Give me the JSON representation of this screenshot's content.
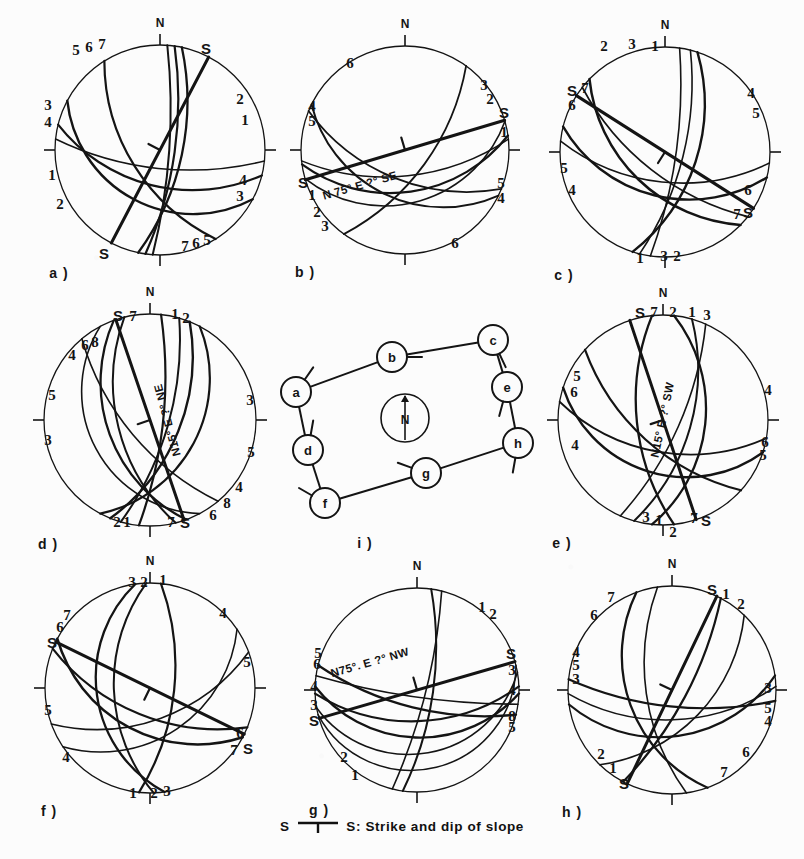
{
  "figure": {
    "background_color": "#fcfcfc",
    "ink_color": "#141414",
    "caption": {
      "left_symbol": "S",
      "right_symbol": "S",
      "text": ": Strike and dip of slope",
      "icon": "strike-dip-symbol"
    }
  },
  "panels": [
    {
      "id": "a",
      "label": "a )",
      "kind": "stereonet",
      "north_label": "N",
      "cx": 160,
      "cy": 150,
      "r": 105,
      "slope_markers": [
        {
          "text": "S",
          "x": 206,
          "y": 48
        },
        {
          "text": "S",
          "x": 104,
          "y": 253
        }
      ],
      "annotation": null,
      "rim_numbers": [
        {
          "n": "5",
          "x": 76,
          "y": 50
        },
        {
          "n": "6",
          "x": 89,
          "y": 47
        },
        {
          "n": "7",
          "x": 102,
          "y": 44
        },
        {
          "n": "3",
          "x": 48,
          "y": 105
        },
        {
          "n": "4",
          "x": 48,
          "y": 122
        },
        {
          "n": "1",
          "x": 52,
          "y": 175
        },
        {
          "n": "2",
          "x": 60,
          "y": 204
        },
        {
          "n": "2",
          "x": 240,
          "y": 99
        },
        {
          "n": "1",
          "x": 245,
          "y": 120
        },
        {
          "n": "4",
          "x": 243,
          "y": 180
        },
        {
          "n": "3",
          "x": 240,
          "y": 196
        },
        {
          "n": "7",
          "x": 185,
          "y": 246
        },
        {
          "n": "6",
          "x": 196,
          "y": 243
        },
        {
          "n": "5",
          "x": 207,
          "y": 240
        }
      ]
    },
    {
      "id": "b",
      "label": "b )",
      "kind": "stereonet",
      "north_label": "N",
      "cx": 405,
      "cy": 150,
      "r": 104,
      "slope_markers": [
        {
          "text": "S",
          "x": 504,
          "y": 112
        },
        {
          "text": "S",
          "x": 303,
          "y": 182
        }
      ],
      "annotation": {
        "text": "N 75° E ?° SE",
        "x": 360,
        "y": 186,
        "rotate": -16
      },
      "rim_numbers": [
        {
          "n": "6",
          "x": 350,
          "y": 63
        },
        {
          "n": "4",
          "x": 312,
          "y": 106
        },
        {
          "n": "5",
          "x": 312,
          "y": 121
        },
        {
          "n": "1",
          "x": 312,
          "y": 195
        },
        {
          "n": "2",
          "x": 317,
          "y": 212
        },
        {
          "n": "3",
          "x": 325,
          "y": 226
        },
        {
          "n": "3",
          "x": 484,
          "y": 85
        },
        {
          "n": "2",
          "x": 490,
          "y": 99
        },
        {
          "n": "1",
          "x": 504,
          "y": 132
        },
        {
          "n": "5",
          "x": 501,
          "y": 183
        },
        {
          "n": "4",
          "x": 501,
          "y": 198
        },
        {
          "n": "6",
          "x": 455,
          "y": 243
        }
      ]
    },
    {
      "id": "c",
      "label": "c )",
      "kind": "stereonet",
      "north_label": "N",
      "cx": 665,
      "cy": 152,
      "r": 105,
      "slope_markers": [
        {
          "text": "S",
          "x": 572,
          "y": 90
        },
        {
          "text": "S",
          "x": 748,
          "y": 212
        }
      ],
      "annotation": null,
      "rim_numbers": [
        {
          "n": "2",
          "x": 604,
          "y": 46
        },
        {
          "n": "3",
          "x": 632,
          "y": 44
        },
        {
          "n": "1",
          "x": 655,
          "y": 46
        },
        {
          "n": "7",
          "x": 585,
          "y": 88
        },
        {
          "n": "6",
          "x": 572,
          "y": 105
        },
        {
          "n": "5",
          "x": 564,
          "y": 168
        },
        {
          "n": "4",
          "x": 572,
          "y": 190
        },
        {
          "n": "4",
          "x": 751,
          "y": 93
        },
        {
          "n": "5",
          "x": 756,
          "y": 113
        },
        {
          "n": "6",
          "x": 748,
          "y": 190
        },
        {
          "n": "7",
          "x": 737,
          "y": 214
        },
        {
          "n": "1",
          "x": 640,
          "y": 258
        },
        {
          "n": "3",
          "x": 664,
          "y": 256
        },
        {
          "n": "2",
          "x": 677,
          "y": 256
        }
      ]
    },
    {
      "id": "d",
      "label": "d )",
      "kind": "stereonet",
      "north_label": "N",
      "cx": 150,
      "cy": 420,
      "r": 106,
      "slope_markers": [
        {
          "text": "S",
          "x": 118,
          "y": 315
        },
        {
          "text": "S",
          "x": 185,
          "y": 522
        }
      ],
      "annotation": {
        "text": "N15° E ?° NE",
        "x": 168,
        "y": 420,
        "rotate": -105
      },
      "rim_numbers": [
        {
          "n": "7",
          "x": 133,
          "y": 316
        },
        {
          "n": "1",
          "x": 175,
          "y": 314
        },
        {
          "n": "2",
          "x": 186,
          "y": 318
        },
        {
          "n": "4",
          "x": 72,
          "y": 355
        },
        {
          "n": "6",
          "x": 85,
          "y": 345
        },
        {
          "n": "8",
          "x": 95,
          "y": 342
        },
        {
          "n": "5",
          "x": 52,
          "y": 395
        },
        {
          "n": "3",
          "x": 48,
          "y": 440
        },
        {
          "n": "3",
          "x": 250,
          "y": 400
        },
        {
          "n": "5",
          "x": 251,
          "y": 452
        },
        {
          "n": "4",
          "x": 239,
          "y": 487
        },
        {
          "n": "8",
          "x": 227,
          "y": 503
        },
        {
          "n": "6",
          "x": 213,
          "y": 515
        },
        {
          "n": "2",
          "x": 117,
          "y": 522
        },
        {
          "n": "1",
          "x": 127,
          "y": 522
        },
        {
          "n": "7",
          "x": 171,
          "y": 522
        }
      ]
    },
    {
      "id": "i",
      "label": "i )",
      "kind": "map",
      "center_compass": "N",
      "nodes": [
        {
          "id": "a",
          "x": 296,
          "y": 392,
          "tick": 35
        },
        {
          "id": "b",
          "x": 392,
          "y": 357,
          "tick": 90
        },
        {
          "id": "c",
          "x": 493,
          "y": 340,
          "tick": 155
        },
        {
          "id": "d",
          "x": 308,
          "y": 450,
          "tick": 10
        },
        {
          "id": "e",
          "x": 507,
          "y": 387,
          "tick": 195
        },
        {
          "id": "f",
          "x": 325,
          "y": 503,
          "tick": 300
        },
        {
          "id": "g",
          "x": 426,
          "y": 473,
          "tick": 290
        },
        {
          "id": "h",
          "x": 518,
          "y": 443,
          "tick": 190
        }
      ],
      "edges": [
        [
          "a",
          "b"
        ],
        [
          "b",
          "c"
        ],
        [
          "c",
          "e"
        ],
        [
          "e",
          "h"
        ],
        [
          "h",
          "g"
        ],
        [
          "g",
          "f"
        ],
        [
          "f",
          "d"
        ],
        [
          "d",
          "a"
        ]
      ],
      "compass": {
        "x": 405,
        "y": 418,
        "r": 24,
        "label": "N"
      }
    },
    {
      "id": "e",
      "label": "e )",
      "kind": "stereonet",
      "north_label": "N",
      "cx": 663,
      "cy": 420,
      "r": 105,
      "slope_markers": [
        {
          "text": "S",
          "x": 640,
          "y": 312
        },
        {
          "text": "S",
          "x": 706,
          "y": 520
        }
      ],
      "annotation": {
        "text": "N15° E ?° SW",
        "x": 663,
        "y": 420,
        "rotate": -78
      },
      "rim_numbers": [
        {
          "n": "7",
          "x": 654,
          "y": 312
        },
        {
          "n": "2",
          "x": 673,
          "y": 312
        },
        {
          "n": "1",
          "x": 692,
          "y": 312
        },
        {
          "n": "3",
          "x": 707,
          "y": 315
        },
        {
          "n": "5",
          "x": 577,
          "y": 376
        },
        {
          "n": "6",
          "x": 574,
          "y": 392
        },
        {
          "n": "4",
          "x": 575,
          "y": 445
        },
        {
          "n": "4",
          "x": 768,
          "y": 390
        },
        {
          "n": "6",
          "x": 765,
          "y": 442
        },
        {
          "n": "5",
          "x": 763,
          "y": 455
        },
        {
          "n": "3",
          "x": 646,
          "y": 517
        },
        {
          "n": "1",
          "x": 659,
          "y": 520
        },
        {
          "n": "2",
          "x": 673,
          "y": 532
        },
        {
          "n": "7",
          "x": 694,
          "y": 518
        }
      ]
    },
    {
      "id": "f",
      "label": "f )",
      "kind": "stereonet",
      "north_label": "N",
      "cx": 150,
      "cy": 688,
      "r": 105,
      "slope_markers": [
        {
          "text": "S",
          "x": 52,
          "y": 642
        },
        {
          "text": "S",
          "x": 248,
          "y": 748
        }
      ],
      "annotation": null,
      "rim_numbers": [
        {
          "n": "3",
          "x": 132,
          "y": 582
        },
        {
          "n": "2",
          "x": 144,
          "y": 582
        },
        {
          "n": "1",
          "x": 163,
          "y": 580
        },
        {
          "n": "7",
          "x": 67,
          "y": 615
        },
        {
          "n": "6",
          "x": 60,
          "y": 627
        },
        {
          "n": "5",
          "x": 48,
          "y": 710
        },
        {
          "n": "4",
          "x": 66,
          "y": 757
        },
        {
          "n": "4",
          "x": 223,
          "y": 613
        },
        {
          "n": "5",
          "x": 247,
          "y": 662
        },
        {
          "n": "6",
          "x": 240,
          "y": 733
        },
        {
          "n": "7",
          "x": 234,
          "y": 750
        },
        {
          "n": "1",
          "x": 133,
          "y": 793
        },
        {
          "n": "2",
          "x": 154,
          "y": 793
        },
        {
          "n": "3",
          "x": 167,
          "y": 791
        }
      ]
    },
    {
      "id": "g",
      "label": "g )",
      "kind": "stereonet",
      "north_label": "N",
      "cx": 417,
      "cy": 690,
      "r": 102,
      "slope_markers": [
        {
          "text": "S",
          "x": 511,
          "y": 653
        },
        {
          "text": "S",
          "x": 314,
          "y": 720
        }
      ],
      "annotation": {
        "text": "N75°. E ?° NW",
        "x": 370,
        "y": 663,
        "rotate": -16
      },
      "rim_numbers": [
        {
          "n": "1",
          "x": 482,
          "y": 607
        },
        {
          "n": "2",
          "x": 493,
          "y": 614
        },
        {
          "n": "5",
          "x": 318,
          "y": 653
        },
        {
          "n": "6",
          "x": 317,
          "y": 664
        },
        {
          "n": "4",
          "x": 314,
          "y": 686
        },
        {
          "n": "3",
          "x": 314,
          "y": 705
        },
        {
          "n": "3",
          "x": 512,
          "y": 670
        },
        {
          "n": "4",
          "x": 512,
          "y": 690
        },
        {
          "n": "8",
          "x": 512,
          "y": 716
        },
        {
          "n": "5",
          "x": 512,
          "y": 727
        },
        {
          "n": "2",
          "x": 344,
          "y": 757
        },
        {
          "n": "1",
          "x": 355,
          "y": 775
        }
      ]
    },
    {
      "id": "h",
      "label": "h )",
      "kind": "stereonet",
      "north_label": "N",
      "cx": 672,
      "cy": 690,
      "r": 104,
      "slope_markers": [
        {
          "text": "S",
          "x": 712,
          "y": 589
        },
        {
          "text": "S",
          "x": 624,
          "y": 783
        }
      ],
      "annotation": null,
      "rim_numbers": [
        {
          "n": "7",
          "x": 611,
          "y": 597
        },
        {
          "n": "6",
          "x": 594,
          "y": 615
        },
        {
          "n": "1",
          "x": 726,
          "y": 594
        },
        {
          "n": "2",
          "x": 741,
          "y": 604
        },
        {
          "n": "4",
          "x": 576,
          "y": 652
        },
        {
          "n": "5",
          "x": 576,
          "y": 665
        },
        {
          "n": "3",
          "x": 576,
          "y": 679
        },
        {
          "n": "3",
          "x": 768,
          "y": 688
        },
        {
          "n": "5",
          "x": 768,
          "y": 708
        },
        {
          "n": "4",
          "x": 768,
          "y": 721
        },
        {
          "n": "6",
          "x": 746,
          "y": 752
        },
        {
          "n": "2",
          "x": 601,
          "y": 754
        },
        {
          "n": "1",
          "x": 613,
          "y": 768
        },
        {
          "n": "7",
          "x": 724,
          "y": 772
        }
      ]
    }
  ],
  "stereonet_curves": {
    "a": [
      {
        "s": 118,
        "d": 34,
        "w": 2.4
      },
      {
        "s": 104,
        "d": 52,
        "w": 2.2
      },
      {
        "s": 96,
        "d": 70,
        "w": 1.5
      },
      {
        "s": 12,
        "d": 66,
        "w": 2.3
      },
      {
        "s": 8,
        "d": 74,
        "w": 2.2
      },
      {
        "s": 4,
        "d": 80,
        "w": 2.0
      },
      {
        "s": 148,
        "d": 58,
        "w": 2.2
      }
    ],
    "b": [
      {
        "s": 74,
        "d": 36,
        "w": 1.6
      },
      {
        "s": 82,
        "d": 46,
        "w": 2.2
      },
      {
        "s": 84,
        "d": 62,
        "w": 1.5
      },
      {
        "s": 116,
        "d": 40,
        "w": 2.0
      },
      {
        "s": 112,
        "d": 58,
        "w": 1.8
      },
      {
        "s": 36,
        "d": 64,
        "w": 1.8
      }
    ],
    "c": [
      {
        "s": 18,
        "d": 56,
        "w": 2.4
      },
      {
        "s": 14,
        "d": 70,
        "w": 1.6
      },
      {
        "s": 8,
        "d": 78,
        "w": 1.6
      },
      {
        "s": 104,
        "d": 44,
        "w": 2.4
      },
      {
        "s": 96,
        "d": 58,
        "w": 1.6
      },
      {
        "s": 134,
        "d": 50,
        "w": 2.5
      },
      {
        "s": 128,
        "d": 66,
        "w": 1.8
      }
    ],
    "d": [
      {
        "s": 160,
        "d": 46,
        "w": 2.3
      },
      {
        "s": 166,
        "d": 56,
        "w": 2.0
      },
      {
        "s": 152,
        "d": 30,
        "w": 1.6
      },
      {
        "s": 28,
        "d": 40,
        "w": 2.2
      },
      {
        "s": 22,
        "d": 58,
        "w": 2.4
      },
      {
        "s": 16,
        "d": 70,
        "w": 2.0
      },
      {
        "s": 6,
        "d": 76,
        "w": 2.2
      },
      {
        "s": 140,
        "d": 66,
        "w": 1.6
      }
    ],
    "e": [
      {
        "s": 6,
        "d": 46,
        "w": 2.3
      },
      {
        "s": 16,
        "d": 60,
        "w": 2.0
      },
      {
        "s": 24,
        "d": 72,
        "w": 1.6
      },
      {
        "s": 108,
        "d": 36,
        "w": 2.4
      },
      {
        "s": 100,
        "d": 56,
        "w": 1.8
      },
      {
        "s": 132,
        "d": 62,
        "w": 2.2
      },
      {
        "s": 174,
        "d": 62,
        "w": 2.3
      }
    ],
    "f": [
      {
        "s": 172,
        "d": 36,
        "w": 2.3
      },
      {
        "s": 178,
        "d": 52,
        "w": 2.0
      },
      {
        "s": 6,
        "d": 64,
        "w": 2.2
      },
      {
        "s": 56,
        "d": 40,
        "w": 1.6
      },
      {
        "s": 70,
        "d": 56,
        "w": 1.6
      },
      {
        "s": 118,
        "d": 44,
        "w": 2.5
      },
      {
        "s": 112,
        "d": 60,
        "w": 2.2
      }
    ],
    "g": [
      {
        "s": 8,
        "d": 72,
        "w": 2.0
      },
      {
        "s": 14,
        "d": 80,
        "w": 1.6
      },
      {
        "s": 92,
        "d": 40,
        "w": 2.4
      },
      {
        "s": 88,
        "d": 56,
        "w": 2.2
      },
      {
        "s": 80,
        "d": 26,
        "w": 1.6
      },
      {
        "s": 76,
        "d": 14,
        "w": 1.5
      },
      {
        "s": 104,
        "d": 70,
        "w": 2.3
      },
      {
        "s": 98,
        "d": 82,
        "w": 1.6
      }
    ],
    "h": [
      {
        "s": 160,
        "d": 44,
        "w": 2.3
      },
      {
        "s": 172,
        "d": 62,
        "w": 1.6
      },
      {
        "s": 82,
        "d": 42,
        "w": 2.2
      },
      {
        "s": 88,
        "d": 58,
        "w": 1.6
      },
      {
        "s": 96,
        "d": 72,
        "w": 2.2
      },
      {
        "s": 44,
        "d": 52,
        "w": 1.6
      },
      {
        "s": 28,
        "d": 74,
        "w": 2.2
      }
    ]
  }
}
